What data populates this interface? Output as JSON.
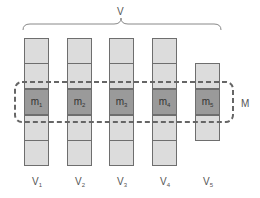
{
  "diagram": {
    "group_label": "V",
    "selection_label": "M",
    "columns": [
      {
        "label": "V",
        "sub": "1",
        "m_label": "m",
        "m_sub": "1",
        "cells": 5,
        "top": 38
      },
      {
        "label": "V",
        "sub": "2",
        "m_label": "m",
        "m_sub": "2",
        "cells": 5,
        "top": 38
      },
      {
        "label": "V",
        "sub": "3",
        "m_label": "m",
        "m_sub": "3",
        "cells": 5,
        "top": 38
      },
      {
        "label": "V",
        "sub": "4",
        "m_label": "m",
        "m_sub": "4",
        "cells": 5,
        "top": 38
      },
      {
        "label": "V",
        "sub": "5",
        "m_label": "m",
        "m_sub": "5",
        "cells": 3,
        "top": 63
      }
    ],
    "colors": {
      "cell_fill": "#dcdcdc",
      "highlight_fill": "#9a9a9a",
      "border": "#6e6e6e",
      "dashed_box": "#666666"
    }
  }
}
